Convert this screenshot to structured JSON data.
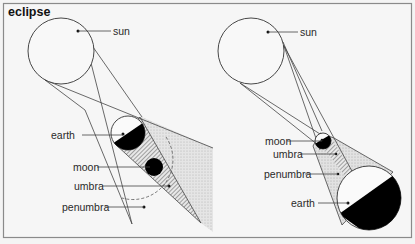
{
  "title": "eclipse",
  "colors": {
    "background": "#f4f4f4",
    "frame": "#8a8a8a",
    "line": "#444444",
    "shadow_fill": "#000000",
    "penumbra_fill": "#dcdcdc"
  },
  "diagrams": [
    {
      "name": "lunar-eclipse",
      "labels": {
        "sun": "sun",
        "earth": "earth",
        "moon": "moon",
        "umbra": "umbra",
        "penumbra": "penumbra"
      }
    },
    {
      "name": "solar-eclipse",
      "labels": {
        "sun": "sun",
        "moon": "moon",
        "umbra": "umbra",
        "penumbra": "penumbra",
        "earth": "earth"
      }
    }
  ]
}
